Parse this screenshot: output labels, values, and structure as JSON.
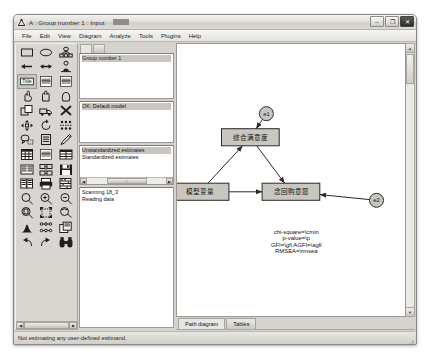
{
  "window": {
    "title": "A : Group number 1 : Input",
    "icon": "amos-app-icon",
    "controls": {
      "minimize": "–",
      "maximize": "❐",
      "close": "✕"
    }
  },
  "menubar": {
    "items": [
      {
        "label": "File",
        "accel": "F"
      },
      {
        "label": "Edit",
        "accel": "E"
      },
      {
        "label": "View",
        "accel": "V"
      },
      {
        "label": "Diagram",
        "accel": "D"
      },
      {
        "label": "Analyze",
        "accel": "A"
      },
      {
        "label": "Tools",
        "accel": "T"
      },
      {
        "label": "Plugins",
        "accel": "P"
      },
      {
        "label": "Help",
        "accel": "H"
      }
    ]
  },
  "toolbox": {
    "tools": [
      {
        "name": "draw-observed-variable-icon",
        "glyph": "rect"
      },
      {
        "name": "draw-unobserved-variable-icon",
        "glyph": "ellipse"
      },
      {
        "name": "draw-latent-with-indicators-icon",
        "glyph": "latent"
      },
      {
        "name": "draw-path-icon",
        "glyph": "arrow-left"
      },
      {
        "name": "draw-covariance-icon",
        "glyph": "arrow-double"
      },
      {
        "name": "add-unique-variable-icon",
        "glyph": "unique-var"
      },
      {
        "name": "figure-caption-icon",
        "glyph": "title"
      },
      {
        "name": "list-variables-in-model-icon",
        "glyph": "list-model"
      },
      {
        "name": "list-variables-in-dataset-icon",
        "glyph": "list-data"
      },
      {
        "name": "select-one-object-icon",
        "glyph": "hand-point"
      },
      {
        "name": "select-all-objects-icon",
        "glyph": "hand-all"
      },
      {
        "name": "deselect-all-objects-icon",
        "glyph": "hand-none"
      },
      {
        "name": "duplicate-objects-icon",
        "glyph": "duplicate"
      },
      {
        "name": "move-objects-icon",
        "glyph": "move-truck"
      },
      {
        "name": "erase-objects-icon",
        "glyph": "erase-x"
      },
      {
        "name": "change-shape-icon",
        "glyph": "resize"
      },
      {
        "name": "rotate-indicators-icon",
        "glyph": "rotate"
      },
      {
        "name": "reflect-indicators-icon",
        "glyph": "reflect"
      },
      {
        "name": "move-parameter-icon",
        "glyph": "move-param"
      },
      {
        "name": "scroll-diagram-icon",
        "glyph": "scroll-page"
      },
      {
        "name": "touch-up-variable-icon",
        "glyph": "touch-up"
      },
      {
        "name": "select-data-file-icon",
        "glyph": "data-file"
      },
      {
        "name": "analysis-properties-icon",
        "glyph": "analysis-props"
      },
      {
        "name": "object-properties-icon",
        "glyph": "object-props"
      },
      {
        "name": "drag-properties-icon",
        "glyph": "drag-props"
      },
      {
        "name": "preserve-symmetries-icon",
        "glyph": "symmetry"
      },
      {
        "name": "save-icon",
        "glyph": "floppy"
      },
      {
        "name": "multiple-group-analysis-icon",
        "glyph": "multi-group"
      },
      {
        "name": "print-icon",
        "glyph": "printer"
      },
      {
        "name": "calculate-estimates-icon",
        "glyph": "abacus"
      },
      {
        "name": "zoom-icon",
        "glyph": "magnifier"
      },
      {
        "name": "zoom-in-icon",
        "glyph": "magnifier-plus"
      },
      {
        "name": "zoom-out-icon",
        "glyph": "magnifier-minus"
      },
      {
        "name": "zoom-page-icon",
        "glyph": "magnifier-page"
      },
      {
        "name": "fit-to-page-icon",
        "glyph": "fit-page"
      },
      {
        "name": "loupe-icon",
        "glyph": "loupe"
      },
      {
        "name": "bayesian-estimation-icon",
        "glyph": "bayes-curve"
      },
      {
        "name": "multiple-models-icon",
        "glyph": "models-grid"
      },
      {
        "name": "print-copies-icon",
        "glyph": "copies"
      },
      {
        "name": "undo-icon",
        "glyph": "undo"
      },
      {
        "name": "redo-icon",
        "glyph": "redo"
      },
      {
        "name": "search-icon",
        "glyph": "binoculars"
      }
    ],
    "selected_index": 6
  },
  "info_column": {
    "tabs": [
      {
        "label": "",
        "active": true
      },
      {
        "label": "",
        "active": false
      }
    ],
    "group_panel": {
      "name": "groups-panel",
      "items": [
        "Group number 1"
      ],
      "selected": "Group number 1"
    },
    "model_panel": {
      "name": "models-panel",
      "items": [
        "OK: Default model"
      ],
      "selected": "OK: Default model"
    },
    "views_panel": {
      "name": "output-views-panel",
      "items": [
        "Unstandardized estimates",
        "Standardized estimates"
      ],
      "selected": "Unstandardized estimates"
    },
    "status_panel": {
      "name": "process-status-panel",
      "lines": [
        "Scanning 18_3",
        "Reading data"
      ]
    }
  },
  "diagram": {
    "tabs": [
      {
        "label": "Path diagram",
        "active": true
      },
      {
        "label": "Tables",
        "active": false
      }
    ],
    "nodes": [
      {
        "id": "n1",
        "name": "latent-node-top",
        "shape": "rect",
        "label": "综合满意度",
        "x": 253,
        "y": 96,
        "w": 54,
        "h": 16
      },
      {
        "id": "n2",
        "name": "observed-node-left",
        "shape": "rect",
        "label": "模型变量",
        "x": 206,
        "y": 147,
        "w": 54,
        "h": 16
      },
      {
        "id": "n3",
        "name": "observed-node-right",
        "shape": "rect",
        "label": "念回购意愿",
        "x": 291,
        "y": 147,
        "w": 54,
        "h": 16
      },
      {
        "id": "e1",
        "name": "error-term-e1",
        "shape": "circle",
        "label": "e1",
        "x": 268,
        "y": 74,
        "r": 6.5
      },
      {
        "id": "e2",
        "name": "error-term-e2",
        "shape": "circle",
        "label": "e2",
        "x": 371,
        "y": 155,
        "r": 6.5
      }
    ],
    "edges": [
      {
        "name": "path-n2-to-n1",
        "from": "n2",
        "to": "n1"
      },
      {
        "name": "path-n1-to-n3",
        "from": "n1",
        "to": "n3"
      },
      {
        "name": "path-n2-to-n3",
        "from": "n2",
        "to": "n3"
      },
      {
        "name": "path-e1-to-n1",
        "from": "e1",
        "to": "n1"
      },
      {
        "name": "path-e2-to-n3",
        "from": "e2",
        "to": "n3"
      }
    ],
    "fit_text": [
      "chi-square=\\cmin",
      "p-value=\\p",
      "GFI=\\gfi   AGFI=\\agfi",
      "RMSEA=\\rmsea"
    ],
    "node_fill": "#c9c6c0",
    "node_stroke": "#2a2a2a",
    "edge_color": "#2a2a2a"
  },
  "statusbar": {
    "text": "Not estimating any user-defined estimand."
  }
}
